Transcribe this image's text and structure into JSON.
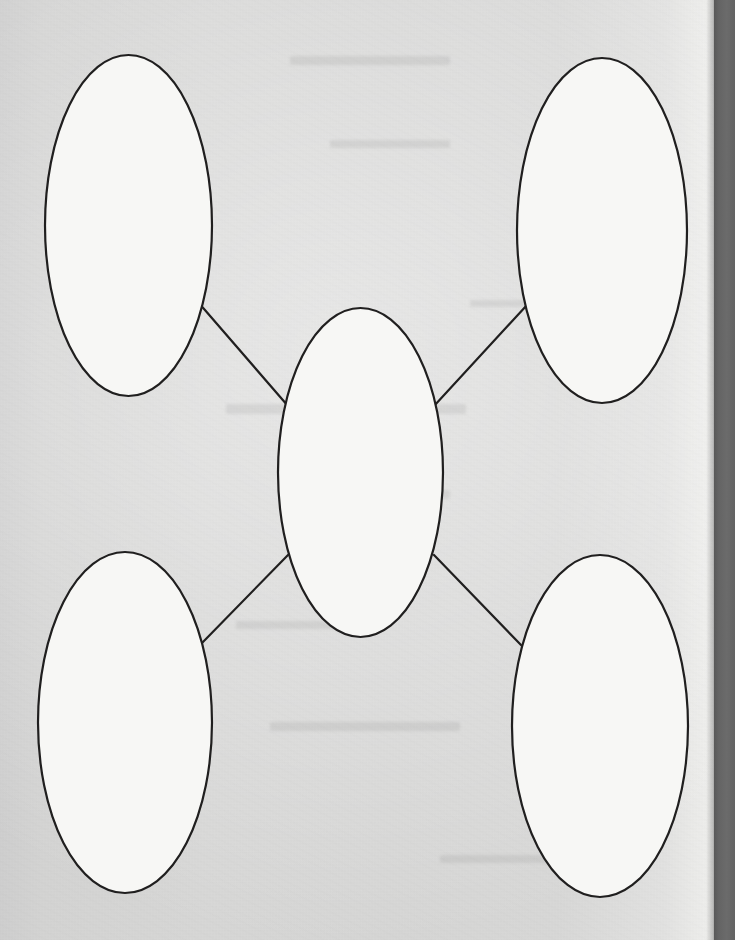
{
  "document": {
    "title": "Blank Concept Map Worksheet",
    "kind": "scanned-worksheet",
    "page_width": 735,
    "page_height": 940
  },
  "colors": {
    "paper": "#d6d6d5",
    "paper_highlight": "#efefed",
    "node_fill": "#f7f7f5",
    "ink": "#201f1f",
    "scan_edge_band": "#646464"
  },
  "diagram": {
    "type": "concept-map",
    "center_node_id": "center",
    "nodes": [
      {
        "id": "top-left",
        "label": "",
        "cx": 128.5,
        "cy": 225.5,
        "rx": 83.5,
        "ry": 170.5
      },
      {
        "id": "top-right",
        "label": "",
        "cx": 602.0,
        "cy": 230.5,
        "rx": 85.0,
        "ry": 172.5
      },
      {
        "id": "center",
        "label": "",
        "cx": 360.5,
        "cy": 472.5,
        "rx": 82.5,
        "ry": 164.5
      },
      {
        "id": "bottom-left",
        "label": "",
        "cx": 125.0,
        "cy": 722.5,
        "rx": 87.0,
        "ry": 170.5
      },
      {
        "id": "bottom-right",
        "label": "",
        "cx": 600.0,
        "cy": 726.0,
        "rx": 88.0,
        "ry": 171.0
      }
    ],
    "connectors": [
      {
        "id": "center-to-top-left",
        "from": "center",
        "to": "top-left",
        "x1": 288,
        "y1": 406,
        "x2": 198,
        "y2": 302
      },
      {
        "id": "center-to-top-right",
        "from": "center",
        "to": "top-right",
        "x1": 434,
        "y1": 406,
        "x2": 527,
        "y2": 305
      },
      {
        "id": "center-to-bottom-left",
        "from": "center",
        "to": "bottom-left",
        "x1": 288,
        "y1": 555,
        "x2": 202,
        "y2": 643
      },
      {
        "id": "center-to-bottom-right",
        "from": "center",
        "to": "bottom-right",
        "x1": 434,
        "y1": 555,
        "x2": 521,
        "y2": 645
      }
    ]
  },
  "showthrough_marks": [
    {
      "x": 290,
      "y": 56,
      "w": 160,
      "h": 9
    },
    {
      "x": 330,
      "y": 140,
      "w": 120,
      "h": 8
    },
    {
      "x": 226,
      "y": 404,
      "w": 240,
      "h": 10
    },
    {
      "x": 300,
      "y": 490,
      "w": 150,
      "h": 9
    },
    {
      "x": 236,
      "y": 621,
      "w": 130,
      "h": 8
    },
    {
      "x": 270,
      "y": 722,
      "w": 190,
      "h": 9
    },
    {
      "x": 440,
      "y": 855,
      "w": 120,
      "h": 8
    },
    {
      "x": 470,
      "y": 300,
      "w": 90,
      "h": 7
    }
  ]
}
